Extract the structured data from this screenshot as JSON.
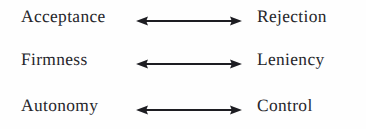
{
  "figure": {
    "type": "bipolar-dimension-diagram",
    "background_color": "#fefefe",
    "text_color": "#26262b",
    "arrow_color": "#1d1d22",
    "arrow_style": "double-headed",
    "rows": [
      {
        "left_label": "Acceptance",
        "right_label": "Rejection",
        "arrow": "double-headed-arrow"
      },
      {
        "left_label": "Firmness",
        "right_label": "Leniency",
        "arrow": "double-headed-arrow"
      },
      {
        "left_label": "Autonomy",
        "right_label": "Control",
        "arrow": "double-headed-arrow"
      }
    ]
  }
}
